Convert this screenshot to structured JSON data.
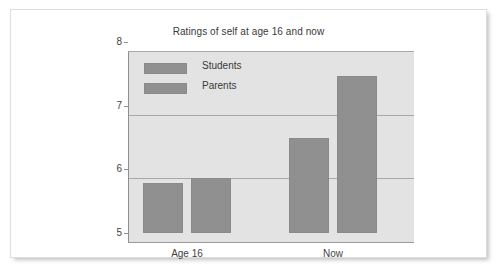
{
  "card": {
    "background": "#ffffff",
    "border_color": "#dedede"
  },
  "chart_data": {
    "type": "bar",
    "title": "Ratings of self at age 16 and now",
    "xlabel": "",
    "ylabel": "",
    "categories": [
      "Age 16",
      "Now"
    ],
    "series": [
      {
        "name": "Students",
        "values": [
          5.78,
          6.5
        ]
      },
      {
        "name": "Parents",
        "values": [
          5.87,
          7.47
        ]
      }
    ],
    "ylim": [
      5,
      8
    ],
    "yticks": [
      5,
      6,
      7,
      8
    ],
    "ytick_labels": [
      "5",
      "6",
      "7",
      "8"
    ],
    "grid": true,
    "legend_position": "top-left",
    "legend_entries": [
      "Students",
      "Parents"
    ],
    "bar_color": "#909090",
    "plot_background": "#e3e3e3",
    "gridline_color": "#a8a8a8"
  }
}
